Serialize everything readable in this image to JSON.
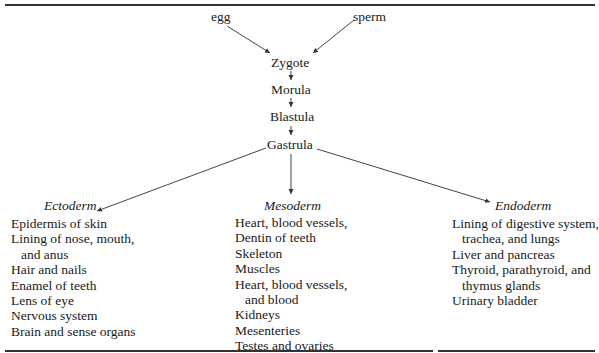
{
  "diagram": {
    "inputs": [
      "egg",
      "sperm"
    ],
    "stages": [
      "Zygote",
      "Morula",
      "Blastula",
      "Gastrula"
    ],
    "germ_layers": [
      {
        "name": "Ectoderm",
        "derivatives": [
          [
            "Epidermis of skin"
          ],
          [
            "Lining of nose, mouth,",
            "and anus"
          ],
          [
            "Hair and nails"
          ],
          [
            "Enamel of teeth"
          ],
          [
            "Lens of eye"
          ],
          [
            "Nervous system"
          ],
          [
            "Brain and sense organs"
          ]
        ]
      },
      {
        "name": "Mesoderm",
        "derivatives": [
          [
            "Heart, blood vessels,"
          ],
          [
            "Dentin of teeth"
          ],
          [
            "Skeleton"
          ],
          [
            "Muscles"
          ],
          [
            "Heart, blood vessels,",
            "and blood"
          ],
          [
            "Kidneys"
          ],
          [
            "Mesenteries"
          ],
          [
            "Testes and ovaries"
          ]
        ]
      },
      {
        "name": "Endoderm",
        "derivatives": [
          [
            "Lining of digestive system,",
            "trachea, and lungs"
          ],
          [
            "Liver and pancreas"
          ],
          [
            "Thyroid, parathyroid, and",
            "thymus glands"
          ],
          [
            "Urinary bladder"
          ]
        ]
      }
    ]
  }
}
